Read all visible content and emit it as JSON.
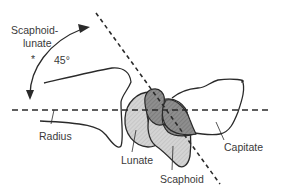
{
  "diagram": {
    "labels": {
      "angle_name_line1": "Scapholunate",
      "angle_name_line1_display": "Scaphoid-",
      "angle_name_line2": "lunate",
      "angle_value": "45°",
      "asterisk": "*",
      "radius": "Radius",
      "lunate": "Lunate",
      "scaphoid": "Scaphoid",
      "capitate": "Capitate"
    },
    "colors": {
      "line": "#2a2a2a",
      "lunate_fill": "#d6d6d6",
      "scaphoid_fill": "#cfcfcf",
      "overlap_fill": "#8c8c8c",
      "text": "#3a3a3a"
    }
  }
}
